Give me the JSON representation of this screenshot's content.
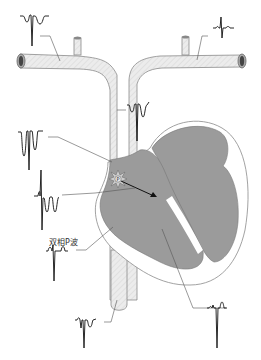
{
  "diagram": {
    "title": "",
    "labels": {
      "biphasic_p_wave": "双相P波",
      "sa_node_marker": "P"
    },
    "colors": {
      "vessel_fill": "#e6e6e6",
      "vessel_stroke": "#888888",
      "heart_fill": "#9a9a9a",
      "heart_outline": "#777777",
      "wall_fill": "#ffffff",
      "trace_stroke": "#111111",
      "leader_stroke": "#555555"
    },
    "waveforms": [
      {
        "id": "left-arm",
        "desc": "inverted P, inverted QRS, inverted T"
      },
      {
        "id": "right-arm",
        "desc": "small P, upright-biphasic QRS, small T"
      },
      {
        "id": "svc-high",
        "desc": "deep inverted waves"
      },
      {
        "id": "high-right-atrium",
        "desc": "deep negative P and QRS"
      },
      {
        "id": "mid-right-atrium",
        "desc": "biphasic P wave with deep QRS"
      },
      {
        "id": "low-right-atrium",
        "desc": "upright P, deep QRS, upright T"
      },
      {
        "id": "ivc",
        "desc": "small P, inverted QRS, T"
      },
      {
        "id": "right-ventricle",
        "desc": "small P, deep QRS, upright T"
      }
    ]
  }
}
